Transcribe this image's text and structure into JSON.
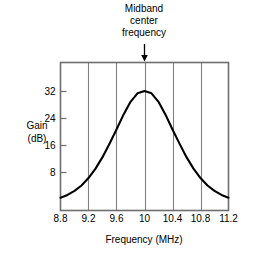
{
  "chart_data": {
    "type": "line",
    "title": "",
    "annotation": {
      "line1": "Midband",
      "line2": "center",
      "line3": "frequency",
      "target_x": 10,
      "marker": "down-arrow"
    },
    "xlabel": "Frequency (MHz)",
    "ylabel_line1": "Gain",
    "ylabel_line2": "(dB)",
    "xlim": [
      8.8,
      11.2
    ],
    "ylim": [
      0,
      36
    ],
    "xticks": [
      8.8,
      9.2,
      9.6,
      10,
      10.4,
      10.8,
      11.2
    ],
    "xticklabels": [
      "8.8",
      "9.2",
      "9.6",
      "10",
      "10.4",
      "10.8",
      "11.2"
    ],
    "yticks": [
      8,
      16,
      24,
      32
    ],
    "yticklabels": [
      "8",
      "16",
      "24",
      "32"
    ],
    "grid": "vertical",
    "legend": "none",
    "line_color": "#000000",
    "grid_color": "#808080",
    "axis_color": "#6e6e6e",
    "series": [
      {
        "name": "Gain",
        "x": [
          8.8,
          8.9,
          9.0,
          9.1,
          9.2,
          9.3,
          9.4,
          9.5,
          9.6,
          9.7,
          9.8,
          9.9,
          10.0,
          10.1,
          10.2,
          10.3,
          10.4,
          10.5,
          10.6,
          10.7,
          10.8,
          10.9,
          11.0,
          11.1,
          11.2
        ],
        "values": [
          0.4,
          1.2,
          2.4,
          4.0,
          6.2,
          9.0,
          12.4,
          16.4,
          20.6,
          25.0,
          28.8,
          31.3,
          32.0,
          31.3,
          28.8,
          25.0,
          20.6,
          16.4,
          12.4,
          9.0,
          6.2,
          4.0,
          2.4,
          1.2,
          0.4
        ]
      }
    ]
  }
}
